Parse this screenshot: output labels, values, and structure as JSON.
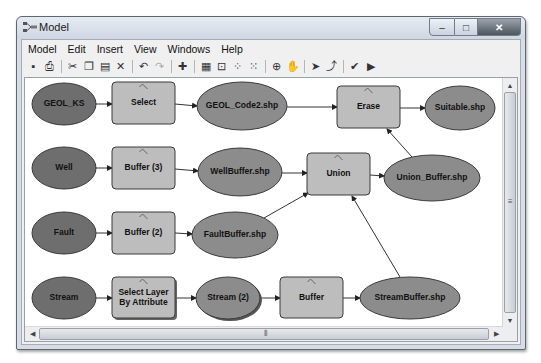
{
  "window": {
    "title": "Model",
    "controls": {
      "minimize": "–",
      "maximize": "□",
      "close": "✕"
    }
  },
  "menubar": {
    "items": [
      {
        "label": "Model"
      },
      {
        "label": "Edit"
      },
      {
        "label": "Insert"
      },
      {
        "label": "View"
      },
      {
        "label": "Windows"
      },
      {
        "label": "Help"
      }
    ]
  },
  "toolbar": {
    "groups": [
      [
        {
          "name": "save-icon",
          "glyph": "▪"
        },
        {
          "name": "print-icon",
          "glyph": "⎙"
        }
      ],
      [
        {
          "name": "cut-icon",
          "glyph": "✂"
        },
        {
          "name": "copy-icon",
          "glyph": "❐"
        },
        {
          "name": "paste-icon",
          "glyph": "▤"
        },
        {
          "name": "delete-icon",
          "glyph": "✕"
        }
      ],
      [
        {
          "name": "undo-icon",
          "glyph": "↶"
        },
        {
          "name": "redo-icon",
          "glyph": "↷"
        }
      ],
      [
        {
          "name": "add-data-icon",
          "glyph": "✚"
        }
      ],
      [
        {
          "name": "auto-layout-icon",
          "glyph": "▦"
        },
        {
          "name": "full-extent-icon",
          "glyph": "⊡"
        },
        {
          "name": "fixed-zoom-in-icon",
          "glyph": "⁘"
        },
        {
          "name": "fixed-zoom-out-icon",
          "glyph": "⁙"
        }
      ],
      [
        {
          "name": "zoom-in-icon",
          "glyph": "⊕"
        },
        {
          "name": "pan-icon",
          "glyph": "✋"
        }
      ],
      [
        {
          "name": "select-pointer-icon",
          "glyph": "➤"
        },
        {
          "name": "connect-icon",
          "glyph": "⤴"
        }
      ],
      [
        {
          "name": "validate-icon",
          "glyph": "✔"
        },
        {
          "name": "run-icon",
          "glyph": "▶"
        }
      ]
    ]
  },
  "colors": {
    "input_fill": "#6e6e6e",
    "output_fill": "#8c8c8c",
    "tool_fill": "#bdbdbd",
    "stroke": "#3a3a3a",
    "canvas": "#ffffff"
  },
  "diagram": {
    "nodes": [
      {
        "id": "geol_ks",
        "label": "GEOL_KS",
        "type": "input",
        "shape": "ellipse",
        "cx": 62,
        "cy": 102,
        "rx": 32,
        "ry": 21
      },
      {
        "id": "select",
        "label": "Select",
        "type": "tool",
        "shape": "rect",
        "x": 110,
        "y": 80,
        "w": 63,
        "h": 42
      },
      {
        "id": "geol_code2",
        "label": "GEOL_Code2.shp",
        "type": "output",
        "shape": "ellipse",
        "cx": 240,
        "cy": 104,
        "rx": 45,
        "ry": 24
      },
      {
        "id": "erase",
        "label": "Erase",
        "type": "tool",
        "shape": "rect",
        "x": 335,
        "y": 84,
        "w": 63,
        "h": 42
      },
      {
        "id": "suitable",
        "label": "Suitable.shp",
        "type": "output",
        "shape": "ellipse",
        "cx": 458,
        "cy": 106,
        "rx": 35,
        "ry": 22
      },
      {
        "id": "well",
        "label": "Well",
        "type": "input",
        "shape": "ellipse",
        "cx": 62,
        "cy": 166,
        "rx": 32,
        "ry": 21
      },
      {
        "id": "buffer3",
        "label": "Buffer (3)",
        "type": "tool",
        "shape": "rect",
        "x": 110,
        "y": 145,
        "w": 63,
        "h": 42
      },
      {
        "id": "wellbuffer",
        "label": "WellBuffer.shp",
        "type": "output",
        "shape": "ellipse",
        "cx": 238,
        "cy": 170,
        "rx": 42,
        "ry": 24
      },
      {
        "id": "union",
        "label": "Union",
        "type": "tool",
        "shape": "rect",
        "x": 305,
        "y": 151,
        "w": 63,
        "h": 42
      },
      {
        "id": "union_buffer",
        "label": "Union_Buffer.shp",
        "type": "output",
        "shape": "ellipse",
        "cx": 430,
        "cy": 176,
        "rx": 48,
        "ry": 23
      },
      {
        "id": "fault",
        "label": "Fault",
        "type": "input",
        "shape": "ellipse",
        "cx": 62,
        "cy": 231,
        "rx": 32,
        "ry": 21
      },
      {
        "id": "buffer2",
        "label": "Buffer (2)",
        "type": "tool",
        "shape": "rect",
        "x": 110,
        "y": 210,
        "w": 63,
        "h": 42
      },
      {
        "id": "faultbuffer",
        "label": "FaultBuffer.shp",
        "type": "output",
        "shape": "ellipse",
        "cx": 233,
        "cy": 233,
        "rx": 43,
        "ry": 23
      },
      {
        "id": "stream",
        "label": "Stream",
        "type": "input",
        "shape": "ellipse",
        "cx": 62,
        "cy": 296,
        "rx": 32,
        "ry": 21
      },
      {
        "id": "select_layer",
        "label": "Select Layer|By Attribute",
        "type": "tool",
        "shape": "rect",
        "x": 110,
        "y": 275,
        "w": 63,
        "h": 41
      },
      {
        "id": "stream2",
        "label": "Stream (2)",
        "type": "output",
        "shape": "ellipse",
        "cx": 226,
        "cy": 296,
        "rx": 32,
        "ry": 21
      },
      {
        "id": "buffer",
        "label": "Buffer",
        "type": "tool",
        "shape": "rect",
        "x": 278,
        "y": 275,
        "w": 63,
        "h": 41
      },
      {
        "id": "streambuffer",
        "label": "StreamBuffer.shp",
        "type": "output",
        "shape": "ellipse",
        "cx": 408,
        "cy": 296,
        "rx": 50,
        "ry": 21
      }
    ],
    "edges": [
      {
        "from": "geol_ks",
        "to": "select",
        "x1": 94,
        "y1": 102,
        "x2": 110,
        "y2": 102
      },
      {
        "from": "select",
        "to": "geol_code2",
        "x1": 173,
        "y1": 102,
        "x2": 195,
        "y2": 104
      },
      {
        "from": "geol_code2",
        "to": "erase",
        "x1": 285,
        "y1": 105,
        "x2": 335,
        "y2": 105
      },
      {
        "from": "erase",
        "to": "suitable",
        "x1": 398,
        "y1": 106,
        "x2": 423,
        "y2": 106
      },
      {
        "from": "well",
        "to": "buffer3",
        "x1": 94,
        "y1": 166,
        "x2": 110,
        "y2": 166
      },
      {
        "from": "buffer3",
        "to": "wellbuffer",
        "x1": 173,
        "y1": 167,
        "x2": 196,
        "y2": 169
      },
      {
        "from": "wellbuffer",
        "to": "union",
        "x1": 280,
        "y1": 171,
        "x2": 305,
        "y2": 171
      },
      {
        "from": "union",
        "to": "union_buffer",
        "x1": 368,
        "y1": 173,
        "x2": 382,
        "y2": 174
      },
      {
        "from": "union_buffer",
        "to": "erase",
        "x1": 410,
        "y1": 155,
        "x2": 385,
        "y2": 127
      },
      {
        "from": "fault",
        "to": "buffer2",
        "x1": 94,
        "y1": 231,
        "x2": 110,
        "y2": 231
      },
      {
        "from": "buffer2",
        "to": "faultbuffer",
        "x1": 173,
        "y1": 231,
        "x2": 190,
        "y2": 232
      },
      {
        "from": "faultbuffer",
        "to": "union",
        "x1": 262,
        "y1": 216,
        "x2": 306,
        "y2": 191
      },
      {
        "from": "stream",
        "to": "select_layer",
        "x1": 94,
        "y1": 296,
        "x2": 110,
        "y2": 296
      },
      {
        "from": "select_layer",
        "to": "stream2",
        "x1": 173,
        "y1": 296,
        "x2": 194,
        "y2": 296
      },
      {
        "from": "stream2",
        "to": "buffer",
        "x1": 258,
        "y1": 296,
        "x2": 278,
        "y2": 296
      },
      {
        "from": "buffer",
        "to": "streambuffer",
        "x1": 341,
        "y1": 296,
        "x2": 358,
        "y2": 296
      },
      {
        "from": "streambuffer",
        "to": "union",
        "x1": 398,
        "y1": 275,
        "x2": 350,
        "y2": 194
      }
    ]
  },
  "scrollbars": {
    "vertical": {
      "up": "▲",
      "down": "▼",
      "grip": "≡"
    },
    "horizontal": {
      "left": "◀",
      "right": "▶",
      "grip": "⦀"
    }
  }
}
